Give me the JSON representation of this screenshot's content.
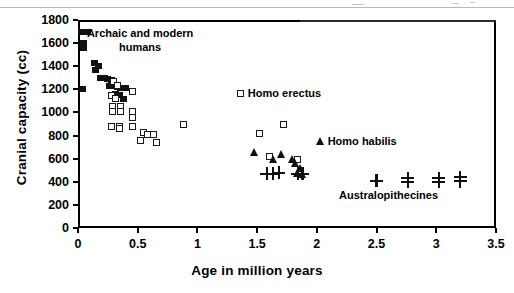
{
  "chart_data": {
    "type": "scatter",
    "title": "",
    "xlabel": "Age in million years",
    "ylabel": "Cranial capacity (cc)",
    "xlim": [
      0,
      3.5
    ],
    "ylim": [
      0,
      1800
    ],
    "xticks": [
      "0",
      "0.5",
      "1",
      "1.5",
      "2",
      "2.5",
      "3",
      "3.5"
    ],
    "xtick_values": [
      0,
      0.5,
      1,
      1.5,
      2,
      2.5,
      3,
      3.5
    ],
    "yticks": [
      "0",
      "200",
      "400",
      "600",
      "800",
      "1000",
      "1200",
      "1400",
      "1600",
      "1800"
    ],
    "ytick_values": [
      0,
      200,
      400,
      600,
      800,
      1000,
      1200,
      1400,
      1600,
      1800
    ],
    "grid": false,
    "legend_position": "inline-annotations",
    "series": [
      {
        "name": "Archaic and modern humans",
        "marker": "filled-square",
        "color": "#111111",
        "points": [
          [
            0.03,
            1700
          ],
          [
            0.08,
            1700
          ],
          [
            0.05,
            1600
          ],
          [
            0.05,
            1560
          ],
          [
            0.04,
            1200
          ],
          [
            0.14,
            1430
          ],
          [
            0.17,
            1400
          ],
          [
            0.15,
            1370
          ],
          [
            0.19,
            1300
          ],
          [
            0.22,
            1300
          ],
          [
            0.25,
            1290
          ],
          [
            0.28,
            1280
          ],
          [
            0.26,
            1230
          ],
          [
            0.3,
            1230
          ],
          [
            0.33,
            1220
          ],
          [
            0.36,
            1210
          ],
          [
            0.4,
            1210
          ],
          [
            0.31,
            1160
          ],
          [
            0.35,
            1150
          ],
          [
            0.38,
            1120
          ]
        ]
      },
      {
        "name": "Homo erectus",
        "marker": "open-square",
        "color": "#1a1a1a",
        "points": [
          [
            0.3,
            1265
          ],
          [
            0.33,
            1230
          ],
          [
            0.28,
            1150
          ],
          [
            0.31,
            1120
          ],
          [
            0.29,
            1050
          ],
          [
            0.29,
            1010
          ],
          [
            0.36,
            1050
          ],
          [
            0.36,
            1010
          ],
          [
            0.28,
            880
          ],
          [
            0.35,
            880
          ],
          [
            0.35,
            860
          ],
          [
            0.46,
            1180
          ],
          [
            0.46,
            1010
          ],
          [
            0.46,
            960
          ],
          [
            0.46,
            880
          ],
          [
            0.55,
            830
          ],
          [
            0.58,
            810
          ],
          [
            0.52,
            760
          ],
          [
            0.63,
            810
          ],
          [
            0.66,
            740
          ],
          [
            0.88,
            900
          ],
          [
            1.52,
            820
          ],
          [
            1.72,
            900
          ],
          [
            1.6,
            620
          ],
          [
            1.84,
            590
          ]
        ]
      },
      {
        "name": "Homo habilis",
        "marker": "filled-triangle",
        "color": "#111111",
        "points": [
          [
            1.48,
            660
          ],
          [
            1.64,
            600
          ],
          [
            1.7,
            640
          ],
          [
            1.8,
            600
          ],
          [
            1.82,
            560
          ],
          [
            1.86,
            520
          ],
          [
            1.84,
            480
          ],
          [
            1.88,
            470
          ]
        ]
      },
      {
        "name": "Australopithecines",
        "marker": "plus",
        "color": "#111111",
        "points": [
          [
            1.58,
            470
          ],
          [
            1.63,
            470
          ],
          [
            1.68,
            480
          ],
          [
            1.84,
            470
          ],
          [
            1.88,
            470
          ],
          [
            2.5,
            410
          ],
          [
            2.76,
            430
          ],
          [
            2.76,
            400
          ],
          [
            3.02,
            430
          ],
          [
            3.02,
            400
          ],
          [
            3.2,
            440
          ],
          [
            3.2,
            405
          ]
        ]
      }
    ],
    "annotations": [
      {
        "text": "Archaic and modern\nhumans",
        "x": 0.52,
        "y": 1680
      },
      {
        "text": "Homo erectus",
        "x": 1.33,
        "y": 1165,
        "marker": "open-square"
      },
      {
        "text": "Homo habilis",
        "x": 1.99,
        "y": 755,
        "marker": "filled-triangle"
      },
      {
        "text": "Australopithecines",
        "x": 2.6,
        "y": 275
      }
    ]
  }
}
